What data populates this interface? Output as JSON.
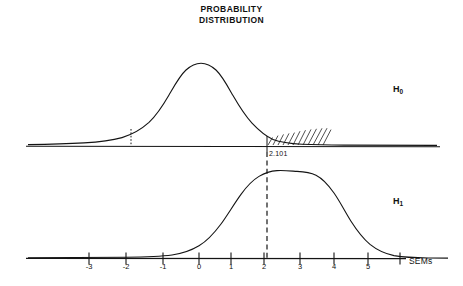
{
  "title": {
    "line1": "PROBABILITY",
    "line2": "DISTRIBUTION"
  },
  "labels": {
    "h0": "H",
    "h0_sub": "0",
    "h1": "H",
    "h1_sub": "1",
    "critical_value": "2.101",
    "axis_unit": "SEMs"
  },
  "chart_data": {
    "type": "line",
    "title": "PROBABILITY DISTRIBUTION",
    "xlabel": "SEMs",
    "ylabel": "",
    "xlim": [
      -4.2,
      6.2
    ],
    "grid": false,
    "legend": "right-inline",
    "tick_labels": [
      "-3",
      "-2",
      "-1",
      "0",
      "1",
      "2",
      "3",
      "4",
      "5"
    ],
    "tick_values": [
      -3,
      -2,
      -1,
      0,
      1,
      2,
      3,
      4,
      5
    ],
    "series": [
      {
        "name": "H0",
        "label": "H₀",
        "type": "normal-density",
        "mean": 0,
        "sd": 1,
        "panel": "top",
        "description": "Null hypothesis sampling distribution centered at 0 SEMs"
      },
      {
        "name": "H1",
        "label": "H₁",
        "type": "normal-density",
        "mean": 2.9,
        "sd": 1,
        "panel": "bottom",
        "description": "Alternative hypothesis sampling distribution centered at about 3 SEMs"
      }
    ],
    "annotations": [
      {
        "name": "critical-value-line",
        "text": "2.101",
        "x": 2.101,
        "style": "dashed-vertical",
        "description": "Critical t value separating acceptance and rejection regions"
      },
      {
        "name": "rejection-region",
        "x_from": 2.101,
        "x_to": 6.2,
        "panel": "top",
        "style": "hatched",
        "description": "Shaded alpha rejection region in the upper tail of H0"
      },
      {
        "name": "lower-marker",
        "x": -2.101,
        "panel": "top",
        "style": "dotted-vertical",
        "description": "Short dotted marker on the left tail of H0"
      }
    ]
  }
}
